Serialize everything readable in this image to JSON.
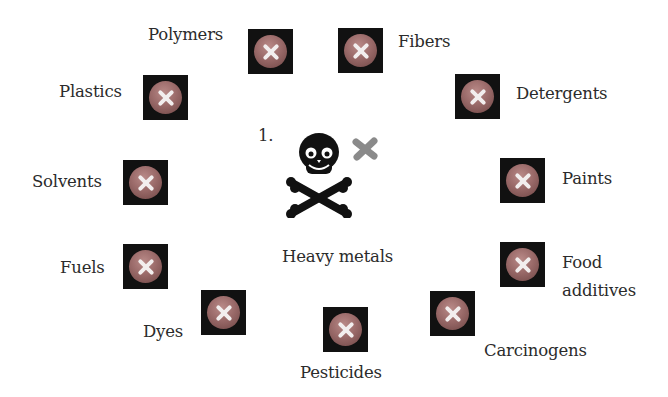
{
  "center": {
    "number": "1.",
    "title": "Heavy metals",
    "icon": "skull-crossbones-icon",
    "mark_icon": "grey-x-mark-icon",
    "mark_color": "#8a8a8a"
  },
  "items": [
    {
      "label": "Polymers",
      "icon": "x-circle-icon"
    },
    {
      "label": "Fibers",
      "icon": "x-circle-icon"
    },
    {
      "label": "Plastics",
      "icon": "x-circle-icon"
    },
    {
      "label": "Detergents",
      "icon": "x-circle-icon"
    },
    {
      "label": "Solvents",
      "icon": "x-circle-icon"
    },
    {
      "label": "Paints",
      "icon": "x-circle-icon"
    },
    {
      "label": "Fuels",
      "icon": "x-circle-icon"
    },
    {
      "label": "Food",
      "label2": "additives",
      "icon": "x-circle-icon"
    },
    {
      "label": "Dyes",
      "icon": "x-circle-icon"
    },
    {
      "label": "Pesticides",
      "icon": "x-circle-icon"
    },
    {
      "label": "Carcinogens",
      "icon": "x-circle-icon"
    }
  ],
  "colors": {
    "icon_box": "#111111",
    "icon_ball": "#9a6a69",
    "icon_x": "#f2eeee",
    "text": "#2b2b2b"
  }
}
